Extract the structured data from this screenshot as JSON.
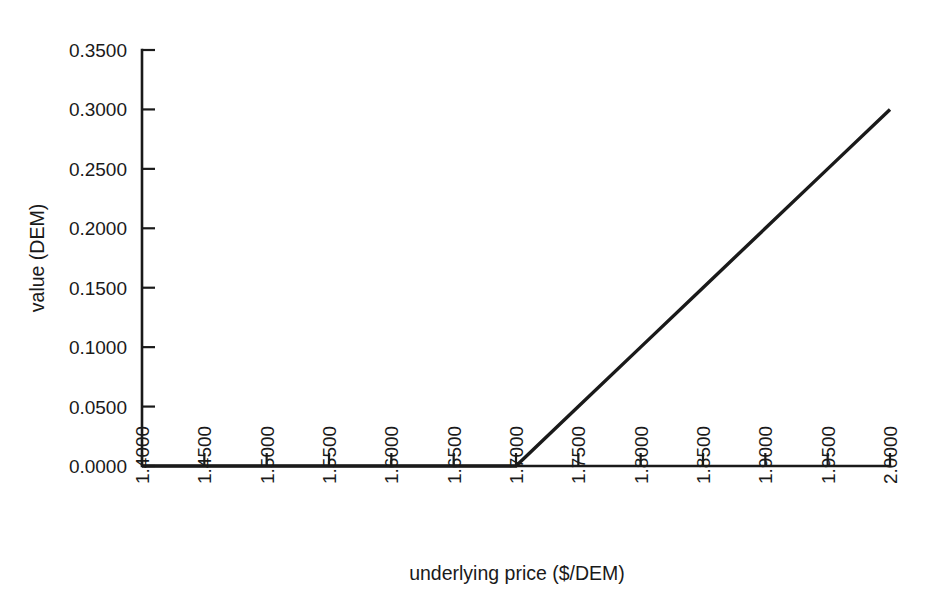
{
  "chart_data": {
    "type": "line",
    "title": "",
    "xlabel": "underlying price ($/DEM)",
    "ylabel": "value (DEM)",
    "xlim": [
      1.4,
      2.0
    ],
    "ylim": [
      0.0,
      0.35
    ],
    "grid": false,
    "legend": "none",
    "x_tick_labels": [
      "1.4000",
      "1.4500",
      "1.5000",
      "1.5500",
      "1.6000",
      "1.6500",
      "1.7000",
      "1.7500",
      "1.8000",
      "1.8500",
      "1.9000",
      "1.9500",
      "2.0000"
    ],
    "x_tick_values": [
      1.4,
      1.45,
      1.5,
      1.55,
      1.6,
      1.65,
      1.7,
      1.75,
      1.8,
      1.85,
      1.9,
      1.95,
      2.0
    ],
    "y_tick_labels": [
      "0.0000",
      "0.0500",
      "0.1000",
      "0.1500",
      "0.2000",
      "0.2500",
      "0.3000",
      "0.3500"
    ],
    "y_tick_values": [
      0.0,
      0.05,
      0.1,
      0.15,
      0.2,
      0.25,
      0.3,
      0.35
    ],
    "x_tick_label_rotation": -90,
    "y_axis_title_rotation": -90,
    "series": [
      {
        "name": "call payoff",
        "color": "#1a1a1a",
        "x": [
          1.4,
          1.45,
          1.5,
          1.55,
          1.6,
          1.65,
          1.7,
          1.75,
          1.8,
          1.85,
          1.9,
          1.95,
          2.0
        ],
        "values": [
          0.0,
          0.0,
          0.0,
          0.0,
          0.0,
          0.0,
          0.0,
          0.05,
          0.1,
          0.15,
          0.2,
          0.25,
          0.3
        ]
      }
    ],
    "annotations": {
      "kink_x": 1.7,
      "kink_y": 0.0,
      "endpoint_x": 2.0,
      "endpoint_y": 0.3
    }
  },
  "colors": {
    "ink": "#1a1a1a",
    "background": "#ffffff"
  }
}
